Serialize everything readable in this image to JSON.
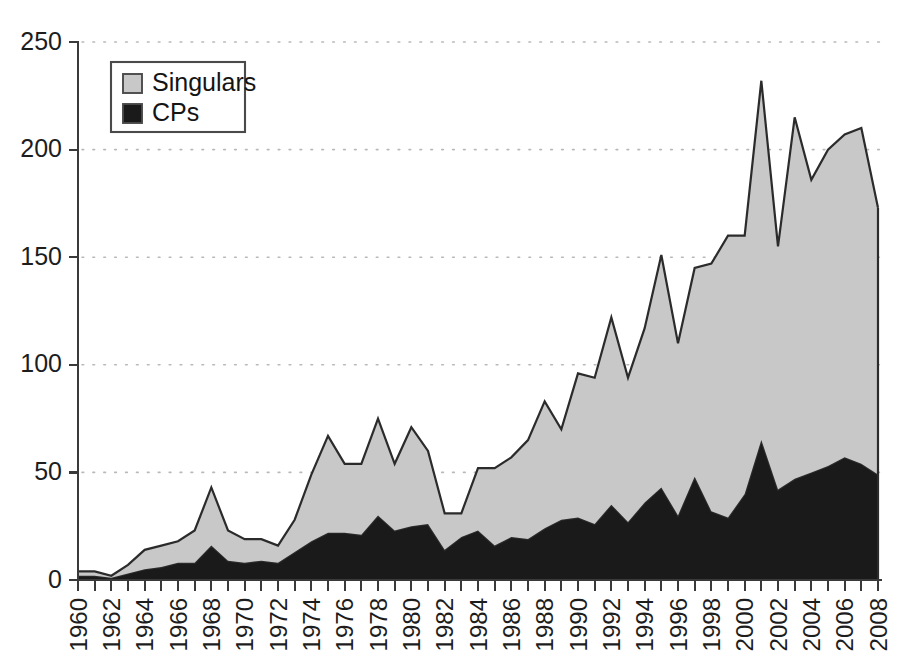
{
  "chart_data": {
    "type": "area",
    "stacked": true,
    "title": "",
    "subtitle": "",
    "xlabel": "",
    "ylabel": "",
    "xlim": [
      1960,
      2008
    ],
    "ylim": [
      0,
      250
    ],
    "yticks": [
      0,
      50,
      100,
      150,
      200,
      250
    ],
    "ytick_labels": [
      "0",
      "50",
      "100",
      "150",
      "200",
      "250"
    ],
    "xticks": [
      1960,
      1962,
      1964,
      1966,
      1968,
      1970,
      1972,
      1974,
      1976,
      1978,
      1980,
      1982,
      1984,
      1986,
      1988,
      1990,
      1992,
      1994,
      1996,
      1998,
      2000,
      2002,
      2004,
      2006,
      2008
    ],
    "xtick_labels": [
      "1960",
      "1962",
      "1964",
      "1966",
      "1968",
      "1970",
      "1972",
      "1974",
      "1976",
      "1978",
      "1980",
      "1982",
      "1984",
      "1986",
      "1988",
      "1990",
      "1992",
      "1994",
      "1996",
      "1998",
      "2000",
      "2002",
      "2004",
      "2006",
      "2008"
    ],
    "xtick_rotation": 90,
    "grid": true,
    "grid_axis": "y",
    "grid_style": "dotted",
    "legend_position": "upper-left",
    "x": [
      1960,
      1961,
      1962,
      1963,
      1964,
      1965,
      1966,
      1967,
      1968,
      1969,
      1970,
      1971,
      1972,
      1973,
      1974,
      1975,
      1976,
      1977,
      1978,
      1979,
      1980,
      1981,
      1982,
      1983,
      1984,
      1985,
      1986,
      1987,
      1988,
      1989,
      1990,
      1991,
      1992,
      1993,
      1994,
      1995,
      1996,
      1997,
      1998,
      1999,
      2000,
      2001,
      2002,
      2003,
      2004,
      2005,
      2006,
      2007,
      2008
    ],
    "series": [
      {
        "name": "CPs",
        "color": "#1a1a1a",
        "stack_order": 0,
        "values": [
          2,
          2,
          1,
          3,
          5,
          6,
          8,
          8,
          16,
          9,
          8,
          9,
          8,
          13,
          18,
          22,
          22,
          21,
          30,
          23,
          25,
          26,
          14,
          20,
          23,
          16,
          20,
          19,
          24,
          28,
          29,
          26,
          35,
          27,
          36,
          43,
          30,
          48,
          32,
          29,
          40,
          65,
          42,
          47,
          50,
          53,
          57,
          54,
          49
        ]
      },
      {
        "name": "Singulars",
        "color": "#c8c8c8",
        "stack_order": 1,
        "values": [
          2,
          2,
          1,
          4,
          9,
          10,
          10,
          15,
          27,
          14,
          11,
          10,
          8,
          15,
          31,
          45,
          32,
          33,
          45,
          31,
          46,
          34,
          17,
          11,
          29,
          36,
          37,
          46,
          59,
          42,
          67,
          68,
          87,
          67,
          81,
          108,
          80,
          97,
          115,
          131,
          120,
          167,
          113,
          168,
          136,
          147,
          150,
          156,
          124
        ]
      }
    ],
    "totals": [
      4,
      4,
      2,
      7,
      14,
      16,
      18,
      23,
      43,
      23,
      19,
      19,
      16,
      28,
      49,
      67,
      54,
      54,
      75,
      54,
      71,
      60,
      31,
      31,
      52,
      52,
      57,
      65,
      83,
      70,
      96,
      94,
      122,
      94,
      117,
      151,
      110,
      145,
      147,
      160,
      160,
      232,
      155,
      215,
      186,
      200,
      207,
      210,
      173
    ]
  },
  "legend": {
    "entries": [
      {
        "label": "Singulars",
        "swatch_color": "#c8c8c8"
      },
      {
        "label": "CPs",
        "swatch_color": "#1a1a1a"
      }
    ]
  },
  "axes": {
    "y_label_0": "0",
    "y_label_50": "50",
    "y_label_100": "100",
    "y_label_150": "150",
    "y_label_200": "200",
    "y_label_250": "250"
  },
  "colors": {
    "singulars": "#c8c8c8",
    "cps": "#1a1a1a",
    "axis": "#3a3a3a",
    "grid": "#b9b9b9",
    "outline": "#2b2b2b",
    "background": "#ffffff"
  }
}
